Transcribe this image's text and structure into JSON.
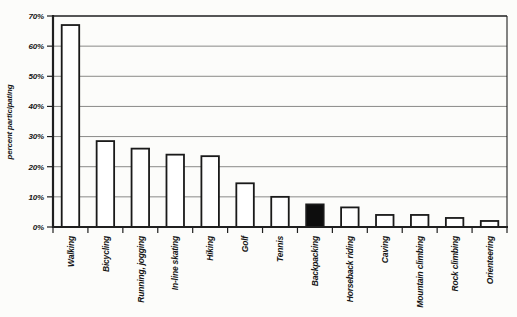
{
  "chart_data": {
    "type": "bar",
    "title": "",
    "xlabel": "",
    "ylabel": "percent participating",
    "ylim": [
      0,
      70
    ],
    "ytick_step": 10,
    "yticks": [
      "0%",
      "10%",
      "20%",
      "30%",
      "40%",
      "50%",
      "60%",
      "70%"
    ],
    "grid": true,
    "legend_position": "none",
    "categories": [
      "Walking",
      "Bicycling",
      "Running, jogging",
      "In-line skating",
      "Hiking",
      "Golf",
      "Tennis",
      "Backpacking",
      "Horseback riding",
      "Caving",
      "Mountain climbing",
      "Rock climbing",
      "Orienteering"
    ],
    "values": [
      67,
      28.5,
      26,
      24,
      23.5,
      14.5,
      10,
      7.5,
      6.5,
      4,
      4,
      3,
      2
    ],
    "highlight_index": 7,
    "x_label_rotation_degrees": -90
  },
  "colors": {
    "background": "#fcfcfa",
    "bar_fill": "#ffffff",
    "bar_outline": "#1a1a1a",
    "highlight_fill": "#0d0d0d",
    "grid": "#8a8a88",
    "axis": "#1f1f1f",
    "text": "#151515"
  }
}
